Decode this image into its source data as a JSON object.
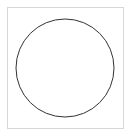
{
  "canvas": {
    "width": 133,
    "height": 138,
    "background_color": "#ffffff"
  },
  "panel": {
    "name": "figure-panel",
    "border_color": "#d6d6d6",
    "border_width": 1,
    "fill_color": "#ffffff",
    "x": 7,
    "y": 7,
    "width": 117,
    "height": 122
  },
  "figure": {
    "type": "geometric-shape",
    "shape": "circle",
    "title": "",
    "caption": "",
    "label": "",
    "stroke_color": "#333333",
    "stroke_width": 1,
    "fill": "none",
    "center_x": 65,
    "center_y": 68,
    "radius": 49,
    "diameter": 98
  },
  "text": {
    "title": "",
    "caption": "",
    "annotations": []
  }
}
